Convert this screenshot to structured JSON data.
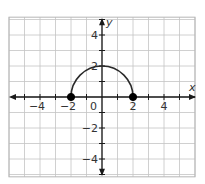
{
  "chart_data": {
    "type": "line",
    "title": "",
    "xlabel": "x",
    "ylabel": "y",
    "xlim": [
      -6,
      6
    ],
    "ylim": [
      -5.15,
      5.15
    ],
    "grid": true,
    "x_ticks": [
      -4,
      -2,
      0,
      2,
      4
    ],
    "y_ticks": [
      -4,
      -2,
      2,
      4
    ],
    "x_tick_labels": [
      "−4",
      "−2",
      "0",
      "2",
      "4"
    ],
    "y_tick_labels": [
      "−4",
      "−2",
      "2",
      "4"
    ],
    "origin_label": "0",
    "series": [
      {
        "name": "upper semicircle y = sqrt(4 - x^2)",
        "kind": "semicircle",
        "center": [
          0,
          0
        ],
        "radius": 2,
        "domain": [
          -2,
          2
        ],
        "range": [
          0,
          2
        ]
      }
    ],
    "points": [
      {
        "x": -2,
        "y": 0,
        "filled": true
      },
      {
        "x": 2,
        "y": 0,
        "filled": true
      }
    ],
    "colors": {
      "grid": "#c4c4c4",
      "border": "#b5b5b5",
      "axis": "#1a1a1a",
      "curve": "#2a2a2a",
      "point": "#000000"
    }
  }
}
